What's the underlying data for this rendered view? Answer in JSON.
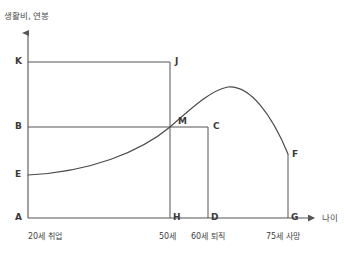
{
  "chart_data": {
    "type": "line",
    "title": "",
    "xlabel": "나이",
    "ylabel": "생활비, 연봉",
    "grid": false,
    "legend": null,
    "xlim": [
      20,
      80
    ],
    "ylim": [
      0,
      100
    ],
    "axis_points": {
      "y_labels": [
        "K",
        "B",
        "E",
        "A"
      ],
      "x_labels": [
        "A",
        "H",
        "D",
        "G"
      ]
    },
    "x_ticks": [
      {
        "label": "20세 취업",
        "age": 20,
        "point": "A"
      },
      {
        "label": "50세",
        "age": 50,
        "point": "H"
      },
      {
        "label": "60세 퇴직",
        "age": 60,
        "point": "D"
      },
      {
        "label": "75세 사망",
        "age": 75,
        "point": "G"
      }
    ],
    "y_ticks": [
      {
        "label": "K",
        "level": "K",
        "desc": "생활비 상한"
      },
      {
        "label": "B",
        "level": "B",
        "desc": "생활비"
      },
      {
        "label": "E",
        "level": "E",
        "desc": "초기 연봉"
      },
      {
        "label": "A",
        "level": "A",
        "desc": "원점"
      }
    ],
    "points": [
      {
        "name": "A",
        "x": 28,
        "y": 218
      },
      {
        "name": "K",
        "x": 28,
        "y": 62
      },
      {
        "name": "J",
        "x": 170,
        "y": 62
      },
      {
        "name": "H",
        "x": 170,
        "y": 218
      },
      {
        "name": "B",
        "x": 28,
        "y": 127
      },
      {
        "name": "M",
        "x": 170,
        "y": 127
      },
      {
        "name": "C",
        "x": 208,
        "y": 127
      },
      {
        "name": "D",
        "x": 208,
        "y": 218
      },
      {
        "name": "E",
        "x": 28,
        "y": 175
      },
      {
        "name": "F",
        "x": 288,
        "y": 154
      },
      {
        "name": "G",
        "x": 288,
        "y": 218
      }
    ],
    "series": [
      {
        "name": "연봉 곡선",
        "path": "M 28 175 C 90 172, 140 152, 170 127 C 196 104, 212 90, 228 87 C 250 85, 272 115, 288 154"
      }
    ],
    "rectangles": [
      {
        "name": "living-cost-box",
        "points": [
          "A",
          "K",
          "J",
          "H"
        ]
      },
      {
        "name": "salary-box",
        "points": [
          "A",
          "B",
          "C",
          "D"
        ]
      }
    ]
  },
  "labels": {
    "y_axis_title": "생활비, 연봉",
    "x_axis_title": "나이",
    "K": "K",
    "J": "J",
    "B": "B",
    "M": "M",
    "C": "C",
    "E": "E",
    "F": "F",
    "A": "A",
    "H": "H",
    "D": "D",
    "G": "G",
    "tick_20": "20세 취업",
    "tick_50": "50세",
    "tick_60": "60세 퇴직",
    "tick_75": "75세 사망"
  },
  "colors": {
    "background": "#ffffff",
    "line": "#4a4a4a",
    "axis": "#555555",
    "text": "#3a3a3a"
  }
}
